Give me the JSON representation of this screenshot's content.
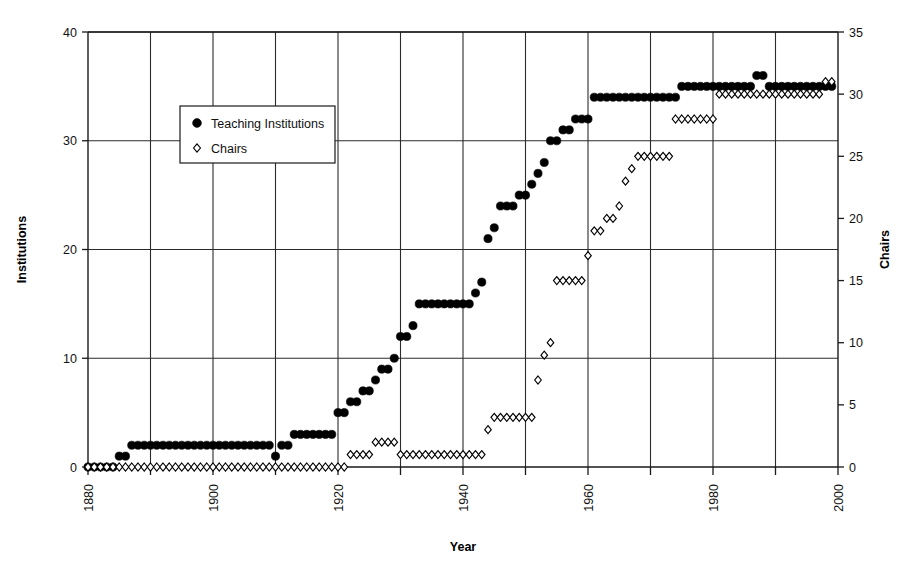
{
  "chart_data": {
    "type": "scatter",
    "title": "",
    "xlabel": "Year",
    "ylabel": "Institutions",
    "y2label": "Chairs",
    "xlim": [
      1880,
      2000
    ],
    "ylim": [
      0,
      40
    ],
    "y2lim": [
      0,
      35
    ],
    "xticks": [
      1880,
      1890,
      1900,
      1910,
      1920,
      1930,
      1940,
      1950,
      1960,
      1970,
      1980,
      1990,
      2000
    ],
    "xtick_labels": [
      "1880",
      "",
      "1900",
      "",
      "1920",
      "",
      "1940",
      "",
      "1960",
      "",
      "1980",
      "",
      "2000"
    ],
    "yticks": [
      0,
      10,
      20,
      30,
      40
    ],
    "ytick_labels": [
      "0",
      "10",
      "20",
      "30",
      "40"
    ],
    "y2ticks": [
      0,
      5,
      10,
      15,
      20,
      25,
      30,
      35
    ],
    "y2tick_labels": [
      "0",
      "5",
      "10",
      "15",
      "20",
      "25",
      "30",
      "35"
    ],
    "grid": true,
    "grid_x": true,
    "grid_y": true,
    "legend_position": "upper-left-inside",
    "marker_color": "#000000",
    "series": [
      {
        "name": "Teaching Institutions",
        "axis": "left",
        "marker": "filled-circle",
        "x": [
          1880,
          1881,
          1882,
          1883,
          1884,
          1885,
          1886,
          1887,
          1888,
          1889,
          1890,
          1891,
          1892,
          1893,
          1894,
          1895,
          1896,
          1897,
          1898,
          1899,
          1900,
          1901,
          1902,
          1903,
          1904,
          1905,
          1906,
          1907,
          1908,
          1909,
          1910,
          1911,
          1912,
          1913,
          1914,
          1915,
          1916,
          1917,
          1918,
          1919,
          1920,
          1921,
          1922,
          1923,
          1924,
          1925,
          1926,
          1927,
          1928,
          1929,
          1930,
          1931,
          1932,
          1933,
          1934,
          1935,
          1936,
          1937,
          1938,
          1939,
          1940,
          1941,
          1942,
          1943,
          1944,
          1945,
          1946,
          1947,
          1948,
          1949,
          1950,
          1951,
          1952,
          1953,
          1954,
          1955,
          1956,
          1957,
          1958,
          1959,
          1960,
          1961,
          1962,
          1963,
          1964,
          1965,
          1966,
          1967,
          1968,
          1969,
          1970,
          1971,
          1972,
          1973,
          1974,
          1975,
          1976,
          1977,
          1978,
          1979,
          1980,
          1981,
          1982,
          1983,
          1984,
          1985,
          1986,
          1987,
          1988,
          1989,
          1990,
          1991,
          1992,
          1993,
          1994,
          1995,
          1996,
          1997,
          1998,
          1999
        ],
        "values": [
          0,
          0,
          0,
          0,
          0,
          1,
          1,
          2,
          2,
          2,
          2,
          2,
          2,
          2,
          2,
          2,
          2,
          2,
          2,
          2,
          2,
          2,
          2,
          2,
          2,
          2,
          2,
          2,
          2,
          2,
          1,
          2,
          2,
          3,
          3,
          3,
          3,
          3,
          3,
          3,
          5,
          5,
          6,
          6,
          7,
          7,
          8,
          9,
          9,
          10,
          12,
          12,
          13,
          15,
          15,
          15,
          15,
          15,
          15,
          15,
          15,
          15,
          16,
          17,
          21,
          22,
          24,
          24,
          24,
          25,
          25,
          26,
          27,
          28,
          30,
          30,
          31,
          31,
          32,
          32,
          32,
          34,
          34,
          34,
          34,
          34,
          34,
          34,
          34,
          34,
          34,
          34,
          34,
          34,
          34,
          35,
          35,
          35,
          35,
          35,
          35,
          35,
          35,
          35,
          35,
          35,
          35,
          36,
          36,
          35,
          35,
          35,
          35,
          35,
          35,
          35,
          35,
          35,
          35,
          35
        ]
      },
      {
        "name": "Chairs",
        "axis": "right",
        "marker": "open-diamond",
        "x": [
          1880,
          1881,
          1882,
          1883,
          1884,
          1885,
          1886,
          1887,
          1888,
          1889,
          1890,
          1891,
          1892,
          1893,
          1894,
          1895,
          1896,
          1897,
          1898,
          1899,
          1900,
          1901,
          1902,
          1903,
          1904,
          1905,
          1906,
          1907,
          1908,
          1909,
          1910,
          1911,
          1912,
          1913,
          1914,
          1915,
          1916,
          1917,
          1918,
          1919,
          1920,
          1921,
          1922,
          1923,
          1924,
          1925,
          1926,
          1927,
          1928,
          1929,
          1930,
          1931,
          1932,
          1933,
          1934,
          1935,
          1936,
          1937,
          1938,
          1939,
          1940,
          1941,
          1942,
          1943,
          1944,
          1945,
          1946,
          1947,
          1948,
          1949,
          1950,
          1951,
          1952,
          1953,
          1954,
          1955,
          1956,
          1957,
          1958,
          1959,
          1960,
          1961,
          1962,
          1963,
          1964,
          1965,
          1966,
          1967,
          1968,
          1969,
          1970,
          1971,
          1972,
          1973,
          1974,
          1975,
          1976,
          1977,
          1978,
          1979,
          1980,
          1981,
          1982,
          1983,
          1984,
          1985,
          1986,
          1987,
          1988,
          1989,
          1990,
          1991,
          1992,
          1993,
          1994,
          1995,
          1996,
          1997,
          1998,
          1999
        ],
        "values": [
          0,
          0,
          0,
          0,
          0,
          0,
          0,
          0,
          0,
          0,
          0,
          0,
          0,
          0,
          0,
          0,
          0,
          0,
          0,
          0,
          0,
          0,
          0,
          0,
          0,
          0,
          0,
          0,
          0,
          0,
          0,
          0,
          0,
          0,
          0,
          0,
          0,
          0,
          0,
          0,
          0,
          0,
          1,
          1,
          1,
          1,
          2,
          2,
          2,
          2,
          1,
          1,
          1,
          1,
          1,
          1,
          1,
          1,
          1,
          1,
          1,
          1,
          1,
          1,
          3,
          4,
          4,
          4,
          4,
          4,
          4,
          4,
          7,
          9,
          10,
          15,
          15,
          15,
          15,
          15,
          17,
          19,
          19,
          20,
          20,
          21,
          23,
          24,
          25,
          25,
          25,
          25,
          25,
          25,
          28,
          28,
          28,
          28,
          28,
          28,
          28,
          30,
          30,
          30,
          30,
          30,
          30,
          30,
          30,
          30,
          30,
          30,
          30,
          30,
          30,
          30,
          30,
          30,
          31,
          31
        ]
      }
    ]
  },
  "legend": {
    "items": [
      {
        "label": "Teaching Institutions",
        "marker": "filled-circle"
      },
      {
        "label": "Chairs",
        "marker": "open-diamond"
      }
    ]
  },
  "axes": {
    "left_title": "Institutions",
    "right_title": "Chairs",
    "bottom_title": "Year"
  }
}
